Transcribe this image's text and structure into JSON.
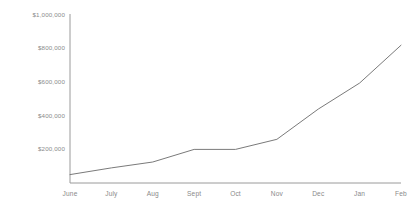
{
  "chart_data": {
    "type": "line",
    "title": "",
    "subtitle": "",
    "xlabel": "",
    "ylabel": "",
    "categories": [
      "June",
      "July",
      "Aug",
      "Sept",
      "Oct",
      "Nov",
      "Dec",
      "Jan",
      "Feb"
    ],
    "values": [
      50000,
      90000,
      125000,
      200000,
      200000,
      260000,
      440000,
      595000,
      820000
    ],
    "series": [
      {
        "name": "revenue",
        "values": [
          50000,
          90000,
          125000,
          200000,
          200000,
          260000,
          440000,
          595000,
          820000
        ]
      }
    ],
    "ylim": [
      0,
      1000000
    ],
    "ytick_values": [
      200000,
      400000,
      600000,
      800000,
      1000000
    ],
    "ytick_labels": [
      "$200,000",
      "$400,000",
      "$600,000",
      "$800,000",
      "$1,000,000"
    ],
    "xtick_labels": [
      "June",
      "July",
      "Aug",
      "Sept",
      "Oct",
      "Nov",
      "Dec",
      "Jan",
      "Feb"
    ],
    "grid": false,
    "legend": false,
    "legend_position": "none",
    "line_color": "#7a7a7a",
    "axis_color": "#9a9a9a",
    "text_color": "#8a8a8a",
    "background_color": "#ffffff",
    "annotations": []
  },
  "axes": {
    "y_axis_name": "y-axis",
    "x_axis_name": "x-axis"
  }
}
